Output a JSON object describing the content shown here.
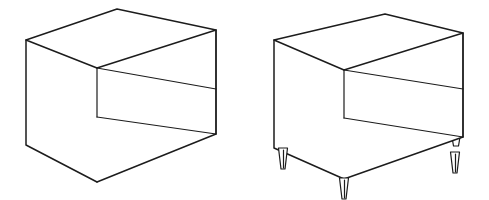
{
  "image": {
    "title": "Box and legged-box isometric line drawings",
    "background_color": "#ffffff",
    "line_color": "#1c1c1c",
    "width": 489,
    "height": 200,
    "style": "black-and-white outline drawing"
  },
  "figures": [
    {
      "id": "figure-left",
      "name": "open-box-no-legs",
      "label": "Open box without legs",
      "description": "Rectangular open-front box drawn in perspective with an interior back panel and floor panel visible; rests directly on the ground.",
      "has_legs": false,
      "leg_count": 0,
      "geometry": {
        "top_back_corner": [
          117,
          9
        ],
        "top_left_corner": [
          26,
          40
        ],
        "top_right_corner": [
          216,
          30
        ],
        "top_front_corner": [
          97,
          68
        ],
        "bottom_left_corner": [
          26,
          145
        ],
        "bottom_front_corner": [
          97,
          182
        ],
        "bottom_right_corner": [
          216,
          134
        ],
        "inner_shelf_left": [
          97,
          117
        ],
        "inner_shelf_right": [
          216,
          134
        ]
      }
    },
    {
      "id": "figure-right",
      "name": "open-box-with-tapered-legs",
      "label": "Open box with four tapered legs",
      "description": "Same rectangular open-front box drawn in perspective, raised on four slender tapered (conical) legs.",
      "has_legs": true,
      "leg_count": 4,
      "leg_style": "tapered-conical",
      "geometry": {
        "top_back_corner": [
          385,
          14
        ],
        "top_left_corner": [
          274,
          40
        ],
        "top_right_corner": [
          463,
          33
        ],
        "top_front_corner": [
          344,
          70
        ],
        "bottom_left_corner": [
          274,
          148
        ],
        "bottom_front_corner": [
          344,
          179
        ],
        "bottom_right_corner": [
          463,
          137
        ],
        "inner_shelf_left": [
          344,
          118
        ],
        "inner_shelf_right": [
          463,
          137
        ]
      },
      "legs": [
        {
          "name": "leg-front-left",
          "top_x": 283,
          "top_y": 148,
          "bottom_y": 169,
          "top_w": 9,
          "bottom_w": 4
        },
        {
          "name": "leg-front-center",
          "top_x": 344,
          "top_y": 178,
          "bottom_y": 199,
          "top_w": 9,
          "bottom_w": 4
        },
        {
          "name": "leg-right",
          "top_x": 455,
          "top_y": 152,
          "bottom_y": 173,
          "top_w": 9,
          "bottom_w": 4
        },
        {
          "name": "leg-back-right",
          "top_x": 456,
          "top_y": 137,
          "bottom_y": 146,
          "top_w": 8,
          "bottom_w": 5
        }
      ]
    }
  ]
}
